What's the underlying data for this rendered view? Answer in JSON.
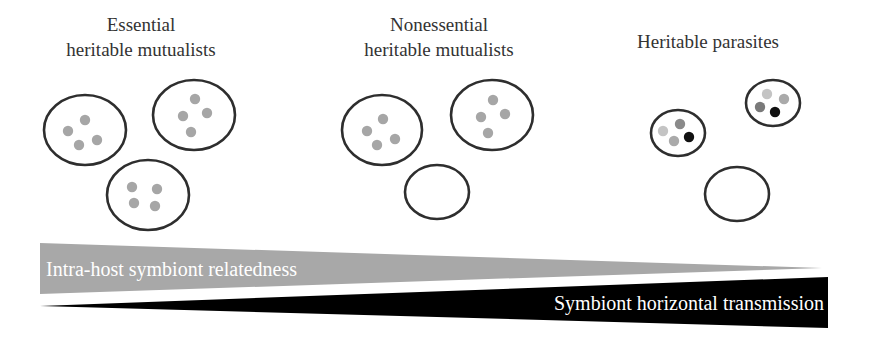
{
  "colors": {
    "background": "#ffffff",
    "text": "#333333",
    "outline": "#2e2e2e",
    "mutualist_dot": "#a6a6a6",
    "wedge_relatedness": "#a8a8a8",
    "wedge_transmission": "#000000",
    "wedge_text": "#ffffff"
  },
  "groups": [
    {
      "id": "essential",
      "title_lines": [
        "Essential",
        "heritable mutualists"
      ],
      "hosts": [
        {
          "cx": 85,
          "cy": 130,
          "rx": 41,
          "ry": 35,
          "symbionts": [
            {
              "cx": 85,
              "cy": 120,
              "color": "#a6a6a6"
            },
            {
              "cx": 68,
              "cy": 131,
              "color": "#a6a6a6"
            },
            {
              "cx": 79,
              "cy": 145,
              "color": "#a6a6a6"
            },
            {
              "cx": 97,
              "cy": 140,
              "color": "#a6a6a6"
            }
          ]
        },
        {
          "cx": 194,
          "cy": 115,
          "rx": 41,
          "ry": 35,
          "symbionts": [
            {
              "cx": 195,
              "cy": 99,
              "color": "#a6a6a6"
            },
            {
              "cx": 183,
              "cy": 116,
              "color": "#a6a6a6"
            },
            {
              "cx": 207,
              "cy": 113,
              "color": "#a6a6a6"
            },
            {
              "cx": 191,
              "cy": 132,
              "color": "#a6a6a6"
            }
          ]
        },
        {
          "cx": 148,
          "cy": 195,
          "rx": 41,
          "ry": 35,
          "symbionts": [
            {
              "cx": 132,
              "cy": 187,
              "color": "#a6a6a6"
            },
            {
              "cx": 157,
              "cy": 189,
              "color": "#a6a6a6"
            },
            {
              "cx": 134,
              "cy": 203,
              "color": "#a6a6a6"
            },
            {
              "cx": 155,
              "cy": 206,
              "color": "#a6a6a6"
            }
          ]
        }
      ]
    },
    {
      "id": "nonessential",
      "title_lines": [
        "Nonessential",
        "heritable mutualists"
      ],
      "hosts": [
        {
          "cx": 382,
          "cy": 130,
          "rx": 40,
          "ry": 35,
          "symbionts": [
            {
              "cx": 383,
              "cy": 119,
              "color": "#a6a6a6"
            },
            {
              "cx": 367,
              "cy": 131,
              "color": "#a6a6a6"
            },
            {
              "cx": 377,
              "cy": 145,
              "color": "#a6a6a6"
            },
            {
              "cx": 395,
              "cy": 139,
              "color": "#a6a6a6"
            }
          ]
        },
        {
          "cx": 492,
          "cy": 115,
          "rx": 41,
          "ry": 35,
          "symbionts": [
            {
              "cx": 493,
              "cy": 100,
              "color": "#a6a6a6"
            },
            {
              "cx": 481,
              "cy": 117,
              "color": "#a6a6a6"
            },
            {
              "cx": 505,
              "cy": 114,
              "color": "#a6a6a6"
            },
            {
              "cx": 488,
              "cy": 133,
              "color": "#a6a6a6"
            }
          ]
        },
        {
          "cx": 437,
          "cy": 192,
          "rx": 32,
          "ry": 27,
          "symbionts": []
        }
      ]
    },
    {
      "id": "parasites",
      "title_lines": [
        "Heritable parasites"
      ],
      "hosts": [
        {
          "cx": 678,
          "cy": 133,
          "rx": 27,
          "ry": 23,
          "symbionts": [
            {
              "cx": 680,
              "cy": 124,
              "color": "#8a8a8a"
            },
            {
              "cx": 663,
              "cy": 131,
              "color": "#c4c4c4"
            },
            {
              "cx": 674,
              "cy": 141,
              "color": "#aaaaaa"
            },
            {
              "cx": 689,
              "cy": 137,
              "color": "#111111"
            }
          ]
        },
        {
          "cx": 773,
          "cy": 103,
          "rx": 27,
          "ry": 23,
          "symbionts": [
            {
              "cx": 767,
              "cy": 94,
              "color": "#c4c4c4"
            },
            {
              "cx": 784,
              "cy": 99,
              "color": "#aaaaaa"
            },
            {
              "cx": 760,
              "cy": 107,
              "color": "#7a7a7a"
            },
            {
              "cx": 775,
              "cy": 112,
              "color": "#111111"
            }
          ]
        },
        {
          "cx": 737,
          "cy": 194,
          "rx": 32,
          "ry": 27,
          "symbionts": []
        }
      ]
    }
  ],
  "gradients": {
    "relatedness": {
      "label": "Intra-host symbiont relatedness",
      "direction": "decreasing left to right",
      "points": "40,243 822,268 40,294"
    },
    "transmission": {
      "label": "Symbiont horizontal transmission",
      "direction": "increasing left to right",
      "points": "40,306 828,277 828,328"
    }
  }
}
